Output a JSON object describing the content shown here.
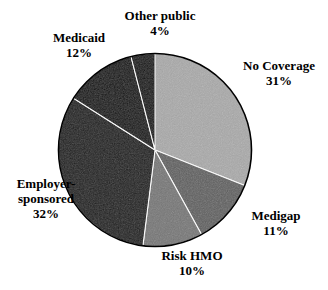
{
  "figure": {
    "kind": "pie-chart",
    "background_color": "#ffffff",
    "label_color": "#000000"
  },
  "chart_data": {
    "type": "pie",
    "title": "",
    "subtitle": "",
    "xlabel": "",
    "ylabel": "",
    "grid": false,
    "legend": "none",
    "label_format": "name on one line, percent on next line",
    "total_percent": 100,
    "start_angle_deg": 0,
    "direction": "clockwise",
    "categories": [
      "No Coverage",
      "Medigap",
      "Risk HMO",
      "Employer-sponsored",
      "Medicaid",
      "Other public"
    ],
    "values": [
      31,
      11,
      10,
      32,
      12,
      4
    ],
    "value_labels": [
      "31%",
      "11%",
      "10%",
      "32%",
      "12%",
      "4%"
    ],
    "slices": [
      {
        "name": "No Coverage",
        "name_lines": [
          "No Coverage"
        ],
        "value": 31,
        "value_label": "31%",
        "color": "#a9a9a9",
        "texture": "speckled light gray"
      },
      {
        "name": "Medigap",
        "name_lines": [
          "Medigap"
        ],
        "value": 11,
        "value_label": "11%",
        "color": "#5f5f5f",
        "texture": "speckled dark gray"
      },
      {
        "name": "Risk HMO",
        "name_lines": [
          "Risk HMO"
        ],
        "value": 10,
        "value_label": "10%",
        "color": "#767676",
        "texture": "speckled medium gray"
      },
      {
        "name": "Employer-sponsored",
        "name_lines": [
          "Employer-",
          "sponsored"
        ],
        "value": 32,
        "value_label": "32%",
        "color": "#1f1f1f",
        "texture": "speckled near black"
      },
      {
        "name": "Medicaid",
        "name_lines": [
          "Medicaid"
        ],
        "value": 12,
        "value_label": "12%",
        "color": "#131313",
        "texture": "black"
      },
      {
        "name": "Other public",
        "name_lines": [
          "Other public"
        ],
        "value": 4,
        "value_label": "4%",
        "color": "#121212",
        "texture": "black thin wedge"
      }
    ]
  },
  "labels": {
    "other_public": {
      "name": "Other public",
      "percent": "4%"
    },
    "medicaid": {
      "name": "Medicaid",
      "percent": "12%"
    },
    "no_coverage": {
      "name": "No Coverage",
      "percent": "31%"
    },
    "medigap": {
      "name": "Medigap",
      "percent": "11%"
    },
    "risk_hmo": {
      "name": "Risk HMO",
      "percent": "10%"
    },
    "employer": {
      "line1": "Employer-",
      "line2": "sponsored",
      "percent": "32%"
    }
  }
}
